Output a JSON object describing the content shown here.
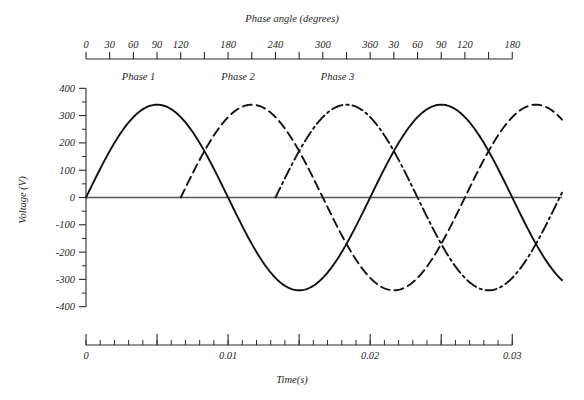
{
  "chart_data": {
    "type": "line",
    "title": "",
    "xlabel": "Time(s)",
    "ylabel": "Voltage (V)",
    "top_axis_label": "Phase angle (degrees)",
    "ylim": [
      -400,
      400
    ],
    "xlim": [
      0,
      0.0335
    ],
    "grid": false,
    "legend_position": "inline-annotations",
    "amplitude_v": 340,
    "frequency_hz": 50,
    "period_s": 0.02,
    "y_ticks": [
      400,
      300,
      200,
      100,
      0,
      -100,
      -200,
      -300,
      -400
    ],
    "y_tick_labels": [
      "400",
      "300",
      "200",
      "100",
      "0",
      "-100",
      "-200",
      "-300",
      "-400"
    ],
    "y_minor_between": 1,
    "top_axis": {
      "label": "Phase angle (degrees)",
      "tick_degrees": [
        0,
        30,
        60,
        90,
        120,
        150,
        180,
        210,
        240,
        270,
        300,
        330,
        360,
        390,
        420,
        450,
        480,
        510,
        540
      ],
      "tick_labels": [
        "0",
        "30",
        "60",
        "90",
        "120",
        "",
        "180",
        "",
        "240",
        "",
        "300",
        "",
        "360",
        "30",
        "60",
        "90",
        "120",
        "",
        "180"
      ]
    },
    "bottom_axis": {
      "label": "Time(s)",
      "major_ticks_s": [
        0,
        0.005,
        0.01,
        0.015,
        0.02,
        0.025,
        0.03
      ],
      "major_tick_labels": [
        "0",
        "",
        "0.01",
        "",
        "0.02",
        "",
        "0.03"
      ],
      "minor_step_s": 0.001
    },
    "series": [
      {
        "name": "Phase 1",
        "label": "Phase 1",
        "phase_deg": 0,
        "line_style": "solid",
        "color": "#111111",
        "start_time_s": 0.0,
        "end_time_s": 0.0335,
        "peaks_v": [
          340,
          340
        ],
        "troughs_v": [
          -340,
          -340
        ]
      },
      {
        "name": "Phase 2",
        "label": "Phase 2",
        "phase_deg": -120,
        "line_style": "dashed",
        "color": "#111111",
        "start_time_s": 0.006667,
        "end_time_s": 0.0335,
        "peaks_v": [
          340,
          340
        ],
        "troughs_v": [
          -340
        ]
      },
      {
        "name": "Phase 3",
        "label": "Phase 3",
        "phase_deg": -240,
        "line_style": "dash-dot",
        "color": "#111111",
        "start_time_s": 0.013333,
        "end_time_s": 0.0335,
        "peaks_v": [
          340,
          340
        ],
        "troughs_v": [
          -340
        ]
      }
    ],
    "annotations": [
      {
        "text": "Phase 1",
        "x_s": 0.0037,
        "y_v": 430
      },
      {
        "text": "Phase 2",
        "x_s": 0.0107,
        "y_v": 430
      },
      {
        "text": "Phase 3",
        "x_s": 0.0177,
        "y_v": 430
      }
    ]
  }
}
